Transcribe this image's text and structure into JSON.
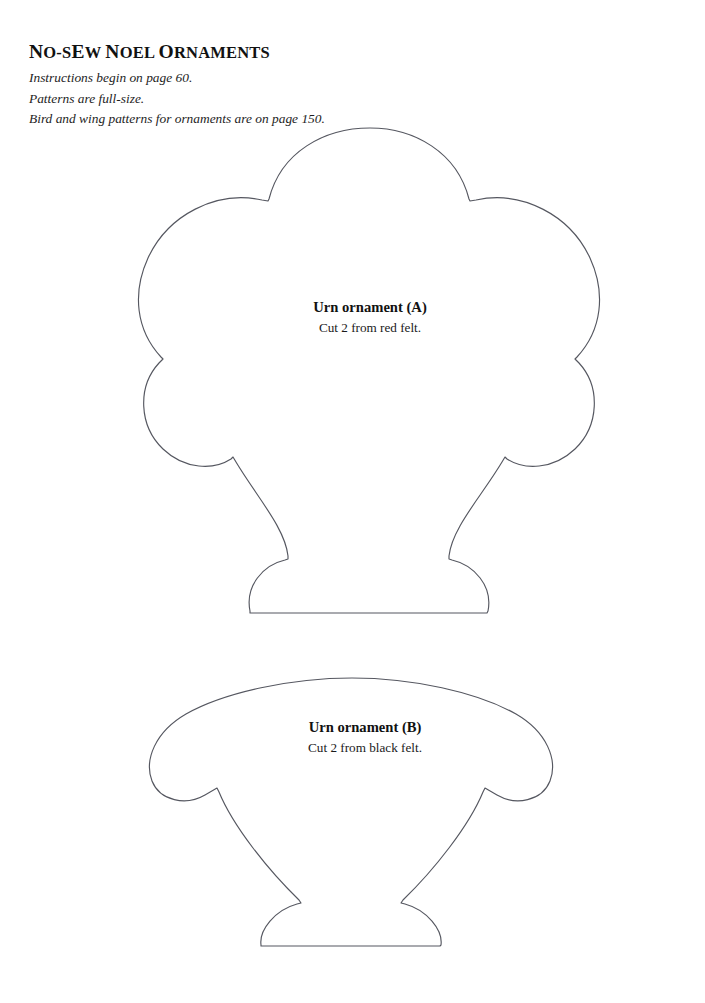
{
  "page": {
    "background_color": "#ffffff",
    "ink_color": "#555760",
    "text_color": "#111111",
    "width": 705,
    "height": 1003
  },
  "header": {
    "title_parts": {
      "n1": "N",
      "rest1": "O-S",
      "e1": "E",
      "rest2": "W ",
      "n2": "N",
      "rest3": "OEL ",
      "o1": "O",
      "rest4": "RNAMENTS"
    },
    "title": "NO-SEW NOEL ORNAMENTS",
    "lines": [
      "Instructions begin on page 60.",
      "Patterns are full-size.",
      "Bird and wing patterns for ornaments are on page 150."
    ]
  },
  "patterns": [
    {
      "id": "ornament-a",
      "title": "Urn ornament (A)",
      "instruction": "Cut 2 from red felt.",
      "shape": "scalloped-urn-top"
    },
    {
      "id": "ornament-b",
      "title": "Urn ornament (B)",
      "instruction": "Cut 2 from black felt.",
      "shape": "wide-bowl-urn-base"
    }
  ]
}
